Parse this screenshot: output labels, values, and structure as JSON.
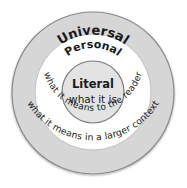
{
  "diagram": {
    "type": "concentric-circles",
    "colors": {
      "outer_ring": "#d6d6d6",
      "middle_ring": "#ffffff",
      "inner_circle": "#e3e3e3",
      "stroke": "#8a8a8a",
      "text": "#1a1a1a"
    },
    "rings": [
      {
        "level": "outer",
        "title": "Universal",
        "description": "what it means in a larger context"
      },
      {
        "level": "middle",
        "title": "Personal",
        "description": "what it means to the reader"
      },
      {
        "level": "inner",
        "title": "Literal",
        "description": "what it is"
      }
    ]
  }
}
